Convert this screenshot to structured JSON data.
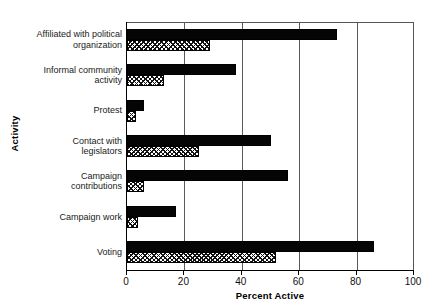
{
  "chart_data": {
    "type": "bar",
    "orientation": "horizontal",
    "title": "",
    "xlabel": "Percent Active",
    "ylabel": "Activity",
    "xlim": [
      0,
      100
    ],
    "xticks": [
      0,
      20,
      40,
      60,
      80,
      100
    ],
    "xtick_labels": [
      "0",
      "20",
      "40",
      "60",
      "80",
      "100"
    ],
    "grid": "vertical",
    "legend": "none",
    "categories": [
      "Affiliated with political organization",
      "Informal community activity",
      "Protest",
      "Contact with legislators",
      "Campaign contributions",
      "Campaign work",
      "Voting"
    ],
    "category_lines": [
      [
        "Affiliated with political",
        "organization"
      ],
      [
        "Informal community",
        "activity"
      ],
      [
        "Protest"
      ],
      [
        "Contact with",
        "legislators"
      ],
      [
        "Campaign",
        "contributions"
      ],
      [
        "Campaign work"
      ],
      [
        "Voting"
      ]
    ],
    "series": [
      {
        "name": "solid",
        "style": "solid-black",
        "color": "#050505",
        "values": [
          73,
          38,
          6,
          50,
          56,
          17,
          86
        ]
      },
      {
        "name": "hatched",
        "style": "cross-hatch",
        "color": "#ffffff",
        "values": [
          29,
          13,
          3,
          25,
          6,
          4,
          52
        ]
      }
    ]
  }
}
